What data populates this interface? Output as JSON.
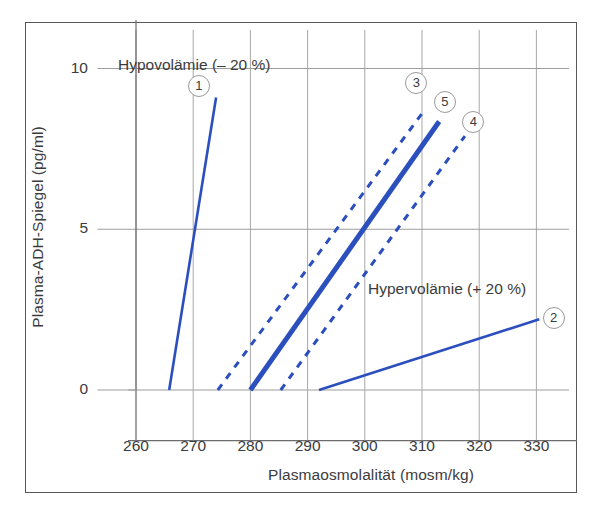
{
  "chart_data": {
    "type": "line",
    "title": "",
    "xlabel": "Plasmaosmolalität (mosm/kg)",
    "ylabel": "Plasma-ADH-Spiegel (pg/ml)",
    "xlim": [
      255,
      335
    ],
    "ylim": [
      -1.2,
      11.2
    ],
    "xticks": [
      260,
      270,
      280,
      290,
      300,
      310,
      320,
      330
    ],
    "yticks": [
      0,
      5,
      10
    ],
    "grid": true,
    "legend": "none",
    "annotations": [
      {
        "id": "hypovolemia",
        "text": "Hypovolämie (– 20 %)",
        "x": 272,
        "y": 10.0
      },
      {
        "id": "hypervolemia",
        "text": "Hypervolämie (+ 20 %)",
        "x": 303,
        "y": 2.7
      }
    ],
    "series": [
      {
        "name": "1",
        "label": "1",
        "style": "solid",
        "width": "thin",
        "color": "#2c4fbe",
        "points": [
          {
            "x": 265.8,
            "y": 0
          },
          {
            "x": 274.0,
            "y": 9.1
          }
        ],
        "marker_label": "1",
        "marker_x": 271.0,
        "marker_y": 9.45
      },
      {
        "name": "3",
        "label": "3",
        "style": "dashed",
        "width": "thin",
        "color": "#2c4fbe",
        "points": [
          {
            "x": 274.3,
            "y": 0
          },
          {
            "x": 310.0,
            "y": 8.6
          }
        ],
        "marker_label": "3",
        "marker_x": 309.0,
        "marker_y": 9.55
      },
      {
        "name": "5",
        "label": "5",
        "style": "solid",
        "width": "thick",
        "color": "#2c4fbe",
        "points": [
          {
            "x": 280.0,
            "y": 0
          },
          {
            "x": 313.0,
            "y": 8.35
          }
        ],
        "marker_label": "5",
        "marker_x": 314.0,
        "marker_y": 8.95
      },
      {
        "name": "4",
        "label": "4",
        "style": "dashed",
        "width": "thin",
        "color": "#2c4fbe",
        "points": [
          {
            "x": 285.3,
            "y": 0
          },
          {
            "x": 317.5,
            "y": 7.9
          }
        ],
        "marker_label": "4",
        "marker_x": 319.0,
        "marker_y": 8.35
      },
      {
        "name": "2",
        "label": "2",
        "style": "solid",
        "width": "thin",
        "color": "#2c4fbe",
        "points": [
          {
            "x": 292.0,
            "y": 0
          },
          {
            "x": 330.5,
            "y": 2.2
          }
        ],
        "marker_label": "2",
        "marker_x": 333.0,
        "marker_y": 2.25
      }
    ]
  },
  "colors": {
    "line": "#2c4fbe",
    "grid": "#9d9d9f",
    "axis": "#58585a",
    "text": "#3b3b3d",
    "frame": "#58585a",
    "background": "#ffffff"
  }
}
